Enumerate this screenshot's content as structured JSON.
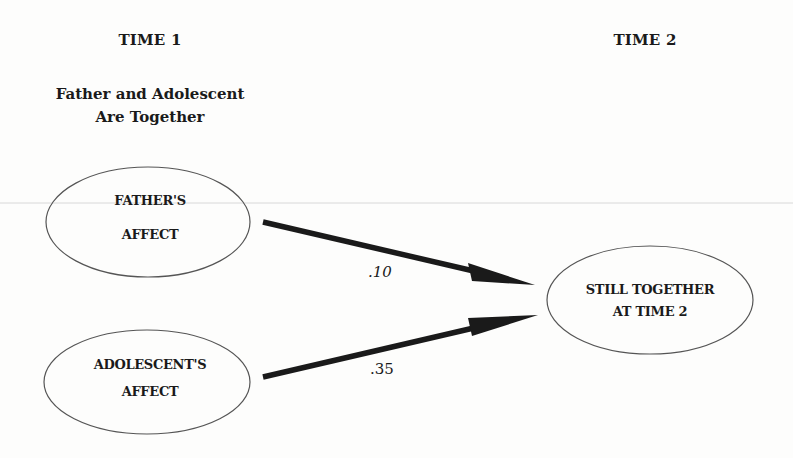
{
  "headers": {
    "time1": "TIME 1",
    "time2": "TIME 2",
    "time1_subtitle_line1": "Father and Adolescent",
    "time1_subtitle_line2": "Are Together"
  },
  "nodes": [
    {
      "id": "fathers-affect",
      "line1": "FATHER'S",
      "line2": "AFFECT"
    },
    {
      "id": "adolescents-affect",
      "line1": "ADOLESCENT'S",
      "line2": "AFFECT"
    },
    {
      "id": "still-together",
      "line1": "STILL TOGETHER",
      "line2": "AT TIME 2"
    }
  ],
  "edges": [
    {
      "from": "fathers-affect",
      "to": "still-together",
      "coefficient": ".10"
    },
    {
      "from": "adolescents-affect",
      "to": "still-together",
      "coefficient": ".35"
    }
  ],
  "colors": {
    "ink": "#1a1a1a",
    "outline": "#555555",
    "background": "#fdfdfc"
  }
}
